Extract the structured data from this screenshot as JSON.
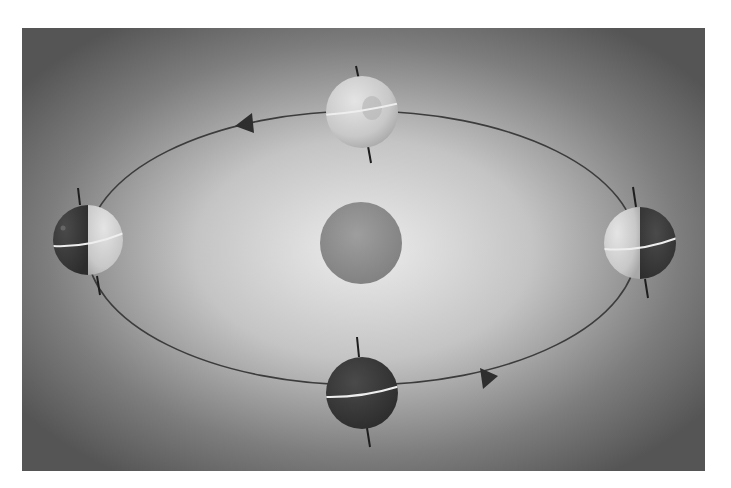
{
  "diagram": {
    "title": "",
    "colors": {
      "background_center": "#e6e6e6",
      "background_edge": "#5a5a5a",
      "orbit_line": "#3c3c3c",
      "arrow_fill": "#2e2e2e",
      "sun_fill": "#8e8e8e",
      "globe_light": "#d2d2d2",
      "globe_dark": "#3a3a3a",
      "equator": "#eeeeee",
      "axis": "#1e1e1e"
    },
    "orbit": {
      "cx": 362,
      "cy": 248,
      "rx": 275,
      "ry": 137
    },
    "sun": {
      "label": "",
      "cx": 361,
      "cy": 243,
      "r": 41
    },
    "earths": [
      {
        "position": "top",
        "cx": 362,
        "cy": 112,
        "r": 36,
        "lit": "full"
      },
      {
        "position": "left",
        "cx": 88,
        "cy": 240,
        "r": 35,
        "lit": "right-half"
      },
      {
        "position": "right",
        "cx": 640,
        "cy": 243,
        "r": 36,
        "lit": "left-half"
      },
      {
        "position": "bottom",
        "cx": 362,
        "cy": 393,
        "r": 36,
        "lit": "none"
      }
    ],
    "arrows": [
      {
        "location": "upper-left",
        "direction": "left",
        "x": 245,
        "y": 123
      },
      {
        "location": "lower-right",
        "direction": "right",
        "x": 490,
        "y": 378
      }
    ],
    "labels": []
  }
}
